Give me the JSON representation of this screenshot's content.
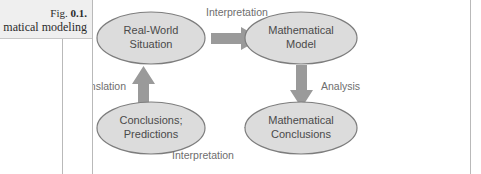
{
  "figure": {
    "caption_label": "Fig.",
    "caption_number": "0.1.",
    "caption_text": "matical modeling",
    "background_color": "#efefef",
    "rule_color": "#b9b9b9"
  },
  "diagram": {
    "type": "cycle-flowchart",
    "node_fill": "#dcdcdc",
    "node_stroke": "#7d7d7d",
    "arrow_color": "#9a9a9a",
    "label_color": "#6e6e6e",
    "nodes": [
      {
        "id": "real-world-situation",
        "line1": "Real-World",
        "line2": "Situation"
      },
      {
        "id": "mathematical-model",
        "line1": "Mathematical",
        "line2": "Model"
      },
      {
        "id": "mathematical-conclusions",
        "line1": "Mathematical",
        "line2": "Conclusions"
      },
      {
        "id": "conclusions-predictions",
        "line1": "Conclusions;",
        "line2": "Predictions"
      }
    ],
    "edges": [
      {
        "id": "edge-top",
        "label": "Interpretation",
        "from": "real-world-situation",
        "to": "mathematical-model",
        "direction": "right"
      },
      {
        "id": "edge-right",
        "label": "Analysis",
        "from": "mathematical-model",
        "to": "mathematical-conclusions",
        "direction": "down"
      },
      {
        "id": "edge-bottom",
        "label": "Interpretation",
        "from": "mathematical-conclusions",
        "to": "conclusions-predictions",
        "direction": "left"
      },
      {
        "id": "edge-left",
        "label": "Translation",
        "from": "conclusions-predictions",
        "to": "real-world-situation",
        "direction": "up"
      }
    ]
  }
}
